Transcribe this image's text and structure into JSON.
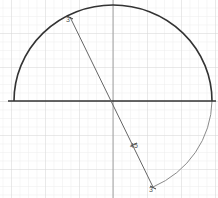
{
  "diagram": {
    "type": "geometry-construction",
    "grid": {
      "minor_spacing_px": 8.5,
      "minor_color": "#e6e6e6",
      "major_color": "#d2d2d2"
    },
    "center": {
      "x": 113,
      "y": 101
    },
    "radius_px": 99,
    "x_axis": {
      "y": 101,
      "x1": 8,
      "x2": 216,
      "color": "#333333"
    },
    "y_axis": {
      "x": 113,
      "y1": 0,
      "y2": 198,
      "color": "#999999"
    },
    "upper_semicircle": {
      "color": "#333333",
      "stroke_width": 1.6
    },
    "lower_arc": {
      "from_deg": 0,
      "to_deg": -60,
      "color": "#888888",
      "stroke_width": 1
    },
    "diameter_segment": {
      "start": {
        "x": 70,
        "y": 17
      },
      "end": {
        "x": 153,
        "y": 187
      },
      "color": "#666666"
    },
    "labels": {
      "top_point": "3",
      "segment_mid": "45",
      "bottom_point": "3"
    }
  }
}
